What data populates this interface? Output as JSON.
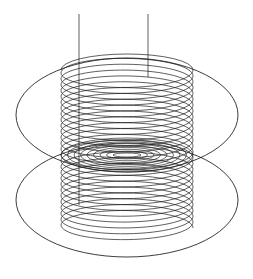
{
  "figure": {
    "kind": "technical-line-drawing",
    "canvas": {
      "width": 253,
      "height": 279,
      "background": "#ffffff"
    },
    "stroke_color": "#1a1a1a",
    "line_width_thin": 0.6,
    "line_width_medium": 0.75,
    "line_width_thick": 0.9
  },
  "coil": {
    "name": "solenoid-helix",
    "turns": 27,
    "center_x": 127,
    "top_y": 70,
    "bottom_y": 228,
    "radius_x": 66,
    "radius_y": 16,
    "left_edge_x": 61,
    "right_edge_x": 193,
    "stroke_width": 0.7
  },
  "leads": [
    {
      "name": "left-lead-wire",
      "x": 79,
      "y_top": 14,
      "y_bottom": 205,
      "stroke_width": 0.7
    },
    {
      "name": "right-lead-wire",
      "x": 148,
      "y_top": 14,
      "y_bottom": 77,
      "stroke_width": 0.7
    }
  ],
  "field_planes": [
    {
      "name": "upper-field-ellipse",
      "center_x": 127,
      "center_y": 115,
      "radius_x": 111,
      "radius_y": 57,
      "stroke_width": 0.85
    },
    {
      "name": "lower-field-ellipse",
      "center_x": 127,
      "center_y": 200,
      "radius_x": 111,
      "radius_y": 57,
      "stroke_width": 0.85
    }
  ],
  "mid_field_lines": {
    "name": "mid-plane-field-ellipses",
    "center_x": 127,
    "center_y": 155,
    "count": 9,
    "radius_x_min": 14,
    "radius_x_max": 66,
    "radius_y_min": 2,
    "radius_y_max": 17,
    "stroke_width": 0.65
  }
}
